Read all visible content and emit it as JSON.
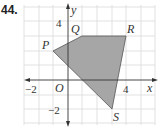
{
  "problem_number": "44.",
  "axes": {
    "x_label": "x",
    "y_label": "y",
    "origin_label": "O",
    "x_ticks": [
      {
        "value": -2,
        "label": "−2"
      },
      {
        "value": 4,
        "label": "4"
      }
    ],
    "y_ticks": [
      {
        "value": 4,
        "label": "4"
      },
      {
        "value": -2,
        "label": "−2"
      }
    ],
    "x_range": [
      -3,
      6
    ],
    "y_range": [
      -3,
      5
    ],
    "grid": true
  },
  "polygon": {
    "fill": "#a6a6a6",
    "vertices": [
      {
        "name": "P",
        "x": -1,
        "y": 2
      },
      {
        "name": "Q",
        "x": 1,
        "y": 3
      },
      {
        "name": "R",
        "x": 4,
        "y": 3
      },
      {
        "name": "S",
        "x": 3,
        "y": -2
      }
    ]
  },
  "colors": {
    "grid": "#d9d9d9",
    "axis": "#333333",
    "shade": "#a6a6a6"
  }
}
